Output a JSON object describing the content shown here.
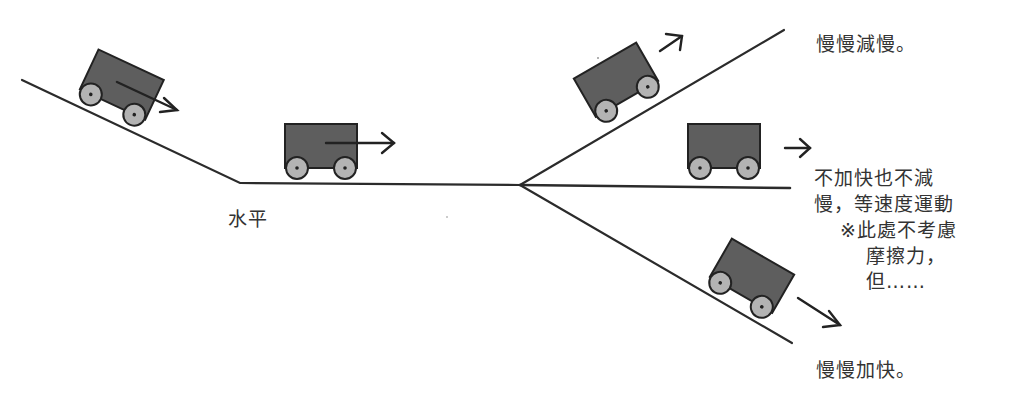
{
  "diagram": {
    "title_cropped": "",
    "colors": {
      "line": "#2b2b2b",
      "cart_body": "#5e5e5e",
      "cart_outline": "#222222",
      "wheel": "#b3b3b3",
      "text": "#333333"
    },
    "track": {
      "left_slope_label": "水平",
      "branches": [
        "uphill",
        "level",
        "downhill"
      ]
    },
    "carts": [
      {
        "id": "cart-downhill-left",
        "position": "left slope",
        "direction": "down-right"
      },
      {
        "id": "cart-level",
        "position": "horizontal",
        "direction": "right"
      },
      {
        "id": "cart-uphill",
        "position": "upper branch",
        "direction": "up-right"
      },
      {
        "id": "cart-level-right",
        "position": "middle branch",
        "direction": "right"
      },
      {
        "id": "cart-downhill-right",
        "position": "lower branch",
        "direction": "down-right"
      }
    ],
    "labels": {
      "horizontal": "水平",
      "uphill": "慢慢減慢。",
      "level_line1": "不加快也不減",
      "level_line2": "慢，等速度運動",
      "note_line1": "※此處不考慮",
      "note_line2": "摩擦力，",
      "note_line3": "但……",
      "downhill": "慢慢加快。"
    }
  }
}
